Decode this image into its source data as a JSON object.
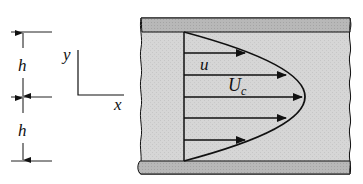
{
  "diagram": {
    "labels": {
      "h_upper": "h",
      "h_lower": "h",
      "axis_y": "y",
      "axis_x": "x",
      "velocity": "u",
      "centerline_velocity": "U",
      "centerline_subscript": "c"
    },
    "colors": {
      "fluid_fill": "#d4d4d4",
      "wall_fill": "#b4b4b4",
      "stroke": "#111111"
    }
  }
}
